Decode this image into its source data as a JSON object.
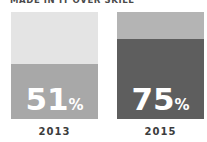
{
  "title": {
    "caption_fragment": "MADE IN IT OVER SKILL"
  },
  "chart_data": {
    "type": "bar",
    "subtype": "stacked-percentage-columns",
    "categories": [
      "2013",
      "2015"
    ],
    "series": [
      {
        "name": "highlighted-share",
        "values": [
          51,
          75
        ]
      },
      {
        "name": "remainder",
        "values": [
          49,
          25
        ]
      }
    ],
    "value_labels": [
      {
        "number": "51",
        "suffix": "%"
      },
      {
        "number": "75",
        "suffix": "%"
      }
    ],
    "ylim": [
      0,
      100
    ],
    "legend": "none",
    "grid": "off",
    "colors": {
      "bar1_top": "#e4e4e4",
      "bar1_bottom": "#a8a8a8",
      "bar2_top": "#b4b4b4",
      "bar2_bottom": "#5e5e5e",
      "value_text": "#ffffff",
      "axis_label_text": "#3c3c3c",
      "caption_text": "#4a4a4a",
      "background": "#ffffff"
    }
  }
}
